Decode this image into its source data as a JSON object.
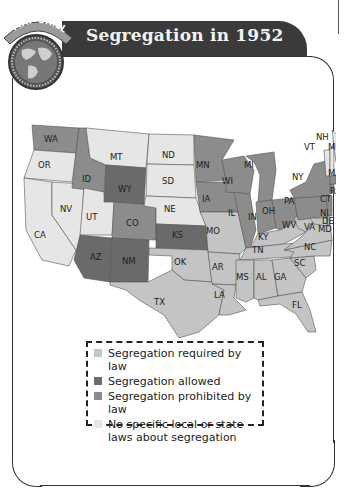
{
  "badge": {
    "label": "MAP SKILL",
    "icon": "globe-icon"
  },
  "header": {
    "title": "Segregation in 1952"
  },
  "colors": {
    "required": "#c4c4c4",
    "allowed": "#6a6a6a",
    "prohibited": "#8c8c8c",
    "none": "#e6e6e6",
    "header_bg": "#3a3a3a"
  },
  "legend": {
    "items": [
      {
        "label": "Segregation required by law",
        "category": "required"
      },
      {
        "label": "Segregation allowed",
        "category": "allowed"
      },
      {
        "label": "Segregation prohibited by law",
        "category": "prohibited"
      },
      {
        "label": "No specific local or state laws about segregation",
        "category": "none"
      }
    ]
  },
  "map": {
    "states": {
      "WA": "prohibited",
      "OR": "none",
      "CA": "none",
      "NV": "none",
      "ID": "prohibited",
      "MT": "none",
      "WY": "allowed",
      "UT": "none",
      "CO": "prohibited",
      "AZ": "allowed",
      "NM": "allowed",
      "ND": "none",
      "SD": "none",
      "NE": "none",
      "KS": "allowed",
      "OK": "required",
      "TX": "required",
      "MN": "prohibited",
      "IA": "prohibited",
      "MO": "required",
      "AR": "required",
      "LA": "required",
      "WI": "prohibited",
      "IL": "prohibited",
      "MI": "prohibited",
      "IN": "prohibited",
      "OH": "prohibited",
      "KY": "required",
      "TN": "required",
      "MS": "required",
      "AL": "required",
      "GA": "required",
      "FL": "required",
      "SC": "required",
      "NC": "required",
      "VA": "required",
      "WV": "required",
      "PA": "prohibited",
      "NY": "prohibited",
      "NJ": "prohibited",
      "DE": "required",
      "MD": "required",
      "CT": "prohibited",
      "RI": "prohibited",
      "MA": "prohibited",
      "VT": "none",
      "NH": "none",
      "ME": "none"
    },
    "labels": [
      "WA",
      "OR",
      "CA",
      "NV",
      "ID",
      "MT",
      "WY",
      "UT",
      "CO",
      "AZ",
      "NM",
      "ND",
      "SD",
      "NE",
      "KS",
      "OK",
      "TX",
      "MN",
      "IA",
      "MO",
      "AR",
      "LA",
      "WI",
      "IL",
      "MI",
      "IN",
      "OH",
      "KY",
      "TN",
      "MS",
      "AL",
      "GA",
      "FL",
      "SC",
      "NC",
      "VA",
      "WV",
      "PA",
      "NY",
      "NJ",
      "DE",
      "MD",
      "CT",
      "RI",
      "MA",
      "VT",
      "NH",
      "ME"
    ]
  }
}
